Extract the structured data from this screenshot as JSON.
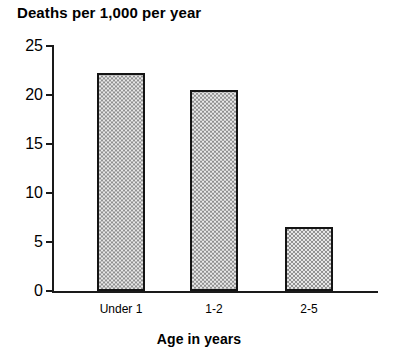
{
  "chart_data": {
    "type": "bar",
    "title": "Deaths per 1,000 per year",
    "xlabel": "Age in years",
    "ylabel": "",
    "categories": [
      "Under 1",
      "1-2",
      "2-5"
    ],
    "values": [
      22.2,
      20.4,
      6.5
    ],
    "ylim": [
      0,
      25
    ],
    "yticks": [
      0,
      5,
      10,
      15,
      20,
      25
    ],
    "ytick_labels": [
      "0",
      "5",
      "10",
      "15",
      "20",
      "25"
    ],
    "grid": false,
    "legend": null,
    "bar_fill": "#c9c9c9",
    "bar_border": "#141414",
    "axis_color": "#1a1a1a",
    "background": "#ffffff"
  },
  "axis": {
    "y_labels": [
      "25",
      "20",
      "15",
      "10",
      "5",
      "0"
    ]
  },
  "bars": [
    {
      "label": "Under 1",
      "value": "22.2"
    },
    {
      "label": "1-2",
      "value": "20.4"
    },
    {
      "label": "2-5",
      "value": "6.5"
    }
  ]
}
